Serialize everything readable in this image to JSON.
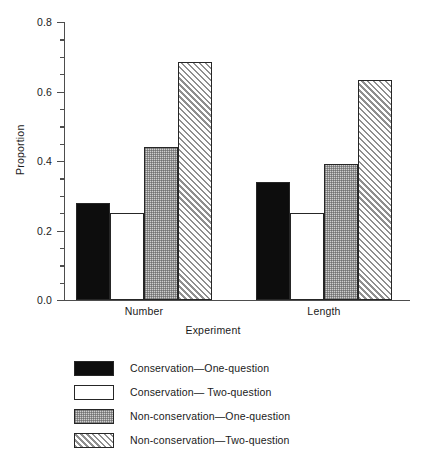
{
  "chart_data": {
    "type": "bar",
    "title": "",
    "xlabel": "Experiment",
    "ylabel": "Proportion",
    "categories": [
      "Number",
      "Length"
    ],
    "ylim": [
      0.0,
      0.8
    ],
    "ytick_labels": [
      "0.0",
      "0.2",
      "0.4",
      "0.6",
      "0.8"
    ],
    "ytick_values": [
      0.0,
      0.2,
      0.4,
      0.6,
      0.8
    ],
    "yminor_values": [
      0.05,
      0.1,
      0.15,
      0.25,
      0.3,
      0.35,
      0.45,
      0.5,
      0.55,
      0.65,
      0.7,
      0.75
    ],
    "grid": false,
    "legend_position": "below-plot",
    "series": [
      {
        "name": "Conservation—One-question",
        "fill": "solid-black",
        "color": "#0d0d0d",
        "values": [
          0.28,
          0.34
        ]
      },
      {
        "name": "Conservation— Two-question",
        "fill": "white",
        "color": "#ffffff",
        "values": [
          0.25,
          0.25
        ]
      },
      {
        "name": "Non-conservation—One-question",
        "fill": "gray-dots",
        "color": "#cfcfcf",
        "values": [
          0.44,
          0.39
        ]
      },
      {
        "name": "Non-conservation—Two-question",
        "fill": "hatch",
        "color": "#8f8f8f",
        "values": [
          0.685,
          0.633
        ]
      }
    ]
  },
  "axis": {
    "ylabel": "Proportion",
    "xlabel": "Experiment"
  }
}
